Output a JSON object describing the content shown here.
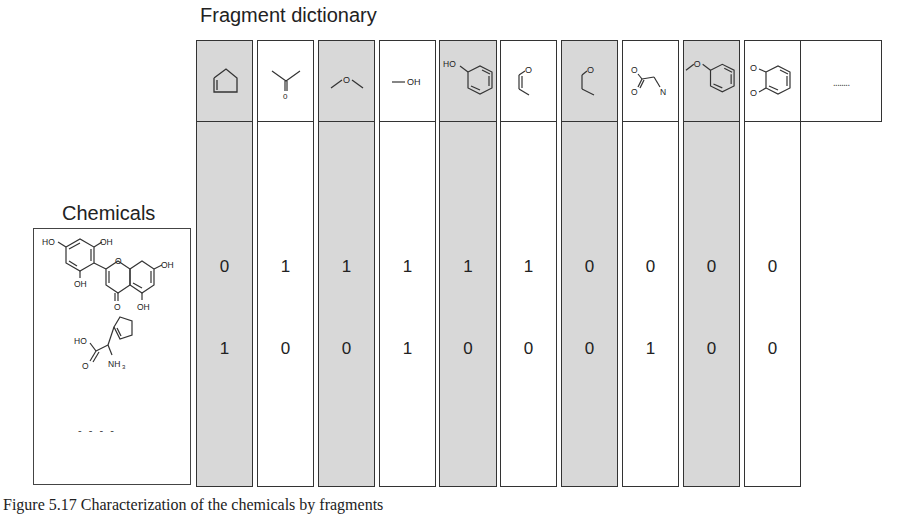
{
  "figure": {
    "title": "Fragment dictionary",
    "chemicals_label": "Chemicals",
    "caption": "Figure 5.17   Characterization of the chemicals by fragments"
  },
  "fragments": [
    {
      "name": "cyclopentene",
      "icon": "cyclopentene-icon",
      "shaded": true
    },
    {
      "name": "ketone",
      "icon": "ketone-icon",
      "label": "O",
      "shaded": false
    },
    {
      "name": "ether",
      "icon": "ether-icon",
      "label": "O",
      "shaded": true
    },
    {
      "name": "hydroxyl",
      "icon": "hydroxyl-icon",
      "label": "OH",
      "shaded": false
    },
    {
      "name": "phenol",
      "icon": "phenol-icon",
      "label": "HO",
      "shaded": true
    },
    {
      "name": "vinyl-oxygen",
      "icon": "vinyl-oxygen-icon",
      "label": "O",
      "shaded": false
    },
    {
      "name": "propyl-oxygen",
      "icon": "propyl-oxygen-icon",
      "label": "O",
      "shaded": true
    },
    {
      "name": "amino-acid",
      "icon": "amino-acid-icon",
      "labels": [
        "O",
        "O",
        "N"
      ],
      "shaded": false
    },
    {
      "name": "methoxy-benzene",
      "icon": "methoxy-benzene-icon",
      "label": "O",
      "shaded": true
    },
    {
      "name": "catechol-ether",
      "icon": "catechol-icon",
      "labels": [
        "O",
        "O"
      ],
      "shaded": false
    },
    {
      "name": "more",
      "icon": "ellipsis-icon",
      "label": "........",
      "shaded": false
    }
  ],
  "chemicals": [
    {
      "name": "flavonoid",
      "labels": [
        "HO",
        "OH",
        "OH",
        "OH",
        "O",
        "OH"
      ],
      "values": [
        0,
        1,
        1,
        1,
        1,
        1,
        0,
        0,
        0,
        0
      ]
    },
    {
      "name": "cyclopentenyl-glycine",
      "labels": [
        "HO",
        "O",
        "NH3"
      ],
      "values": [
        1,
        0,
        0,
        1,
        0,
        0,
        0,
        1,
        0,
        0
      ]
    }
  ],
  "chemicals_more": "- - - -",
  "row1": [
    "0",
    "1",
    "1",
    "1",
    "1",
    "1",
    "0",
    "0",
    "0",
    "0"
  ],
  "row2": [
    "1",
    "0",
    "0",
    "1",
    "0",
    "0",
    "0",
    "1",
    "0",
    "0"
  ],
  "colors": {
    "shade": "#d8d8d8",
    "line": "#333333",
    "text": "#222222"
  }
}
